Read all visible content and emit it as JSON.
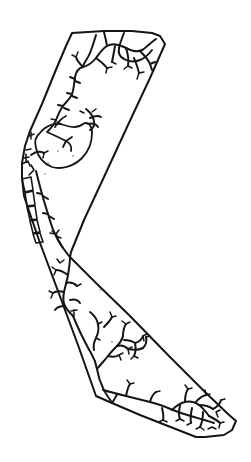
{
  "document": {
    "title": "Hand-drawn bent corridor map sketch",
    "kind": "line-drawing",
    "background_color": "#ffffff",
    "ink_color": "#151515",
    "canvas": {
      "width": 251,
      "height": 462
    }
  },
  "figure": {
    "name": "bent-corridor-map",
    "stroke_color": "#151515",
    "fill_color": "#ffffff",
    "stroke_width": 2
  },
  "geometry": {
    "boundary": {
      "name": "outer-boundary-polygon",
      "vertices": [
        [
          72,
          32
        ],
        [
          160,
          35
        ],
        [
          165,
          44
        ],
        [
          70,
          256
        ],
        [
          236,
          420
        ],
        [
          228,
          434
        ],
        [
          196,
          437
        ],
        [
          95,
          396
        ],
        [
          24,
          200
        ],
        [
          22,
          163
        ],
        [
          30,
          130
        ]
      ],
      "closed": true
    },
    "networks": [
      {
        "name": "upper-arm-network",
        "region": "upper",
        "branch_count": 28
      },
      {
        "name": "lower-arm-network",
        "region": "lower",
        "branch_count": 34
      },
      {
        "name": "left-edge-network",
        "region": "left-margin",
        "branch_count": 16
      }
    ],
    "enclave": {
      "name": "oval-enclave-loop",
      "center": [
        62,
        145
      ],
      "approx_width": 62,
      "approx_height": 52
    },
    "edge_segments": {
      "name": "left-edge-segment-boxes",
      "count": 5,
      "x_range": [
        14,
        30
      ],
      "y_range": [
        178,
        240
      ]
    }
  },
  "annotations": {
    "labels": [],
    "legend": [],
    "scale_bar": null,
    "north_arrow": null
  }
}
